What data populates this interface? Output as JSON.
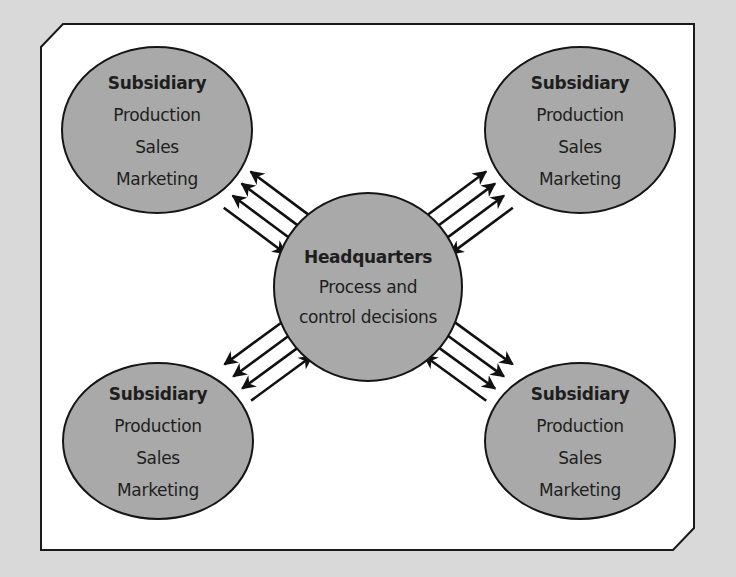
{
  "diagram": {
    "colors": {
      "page_background": "#d9d9d9",
      "frame_fill": "#ffffff",
      "frame_stroke": "#1a1a1a",
      "node_fill": "#a9a9a9",
      "node_stroke": "#151515",
      "arrow": "#111111",
      "text": "#1e1e1e"
    },
    "headquarters": {
      "title": "Headquarters",
      "line1": "Process and",
      "line2": "control decisions"
    },
    "subsidiaries": [
      {
        "position": "top-left",
        "title": "Subsidiary",
        "items": [
          "Production",
          "Sales",
          "Marketing"
        ]
      },
      {
        "position": "top-right",
        "title": "Subsidiary",
        "items": [
          "Production",
          "Sales",
          "Marketing"
        ]
      },
      {
        "position": "bottom-left",
        "title": "Subsidiary",
        "items": [
          "Production",
          "Sales",
          "Marketing"
        ]
      },
      {
        "position": "bottom-right",
        "title": "Subsidiary",
        "items": [
          "Production",
          "Sales",
          "Marketing"
        ]
      }
    ],
    "connections": [
      {
        "between": [
          "headquarters",
          "top-left"
        ],
        "arrows_to_subsidiary": 3,
        "arrows_to_headquarters": 1
      },
      {
        "between": [
          "headquarters",
          "top-right"
        ],
        "arrows_to_subsidiary": 3,
        "arrows_to_headquarters": 1
      },
      {
        "between": [
          "headquarters",
          "bottom-left"
        ],
        "arrows_to_subsidiary": 3,
        "arrows_to_headquarters": 1
      },
      {
        "between": [
          "headquarters",
          "bottom-right"
        ],
        "arrows_to_subsidiary": 3,
        "arrows_to_headquarters": 1
      }
    ]
  }
}
